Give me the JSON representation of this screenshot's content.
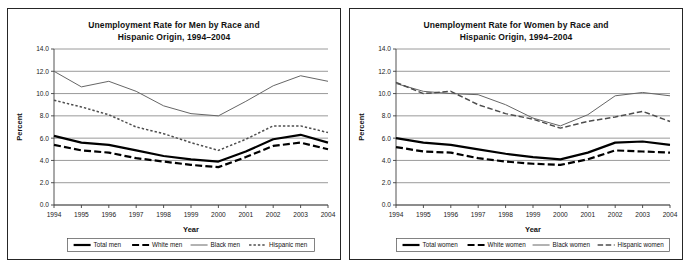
{
  "page": {
    "background": "#ffffff",
    "border_color": "#262626"
  },
  "charts": [
    {
      "id": "men",
      "title_line1": "Unemployment Rate for Men by Race and",
      "title_line2": "Hispanic Origin, 1994–2004",
      "ylabel": "Percent",
      "xlabel": "Year",
      "chart_data": {
        "type": "line",
        "title": "Unemployment Rate for Men by Race and Hispanic Origin, 1994–2004",
        "xlabel": "Year",
        "ylabel": "Percent",
        "x": [
          1994,
          1995,
          1996,
          1997,
          1998,
          1999,
          2000,
          2001,
          2002,
          2003,
          2004
        ],
        "categories": [
          "1994",
          "1995",
          "1996",
          "1997",
          "1998",
          "1999",
          "2000",
          "2001",
          "2002",
          "2003",
          "2004"
        ],
        "ylim": [
          0.0,
          14.0
        ],
        "yticks": [
          "0.0",
          "2.0",
          "4.0",
          "6.0",
          "8.0",
          "10.0",
          "12.0",
          "14.0"
        ],
        "ytick_values": [
          0.0,
          2.0,
          4.0,
          6.0,
          8.0,
          10.0,
          12.0,
          14.0
        ],
        "grid": true,
        "legend_position": "bottom",
        "series": [
          {
            "name": "Total men",
            "style": "solid-thick",
            "color": "#000000",
            "values": [
              6.2,
              5.6,
              5.4,
              4.9,
              4.4,
              4.1,
              3.9,
              4.8,
              5.9,
              6.3,
              5.6
            ]
          },
          {
            "name": "White men",
            "style": "dashed-thick",
            "color": "#000000",
            "values": [
              5.4,
              4.9,
              4.7,
              4.2,
              3.9,
              3.6,
              3.4,
              4.3,
              5.3,
              5.6,
              5.0
            ]
          },
          {
            "name": "Black men",
            "style": "solid-thin",
            "color": "#666666",
            "values": [
              12.0,
              10.6,
              11.1,
              10.2,
              8.9,
              8.2,
              8.0,
              9.3,
              10.7,
              11.6,
              11.1
            ]
          },
          {
            "name": "Hispanic men",
            "style": "dotted",
            "color": "#4d4d4d",
            "values": [
              9.4,
              8.8,
              8.1,
              7.0,
              6.4,
              5.6,
              4.9,
              5.9,
              7.1,
              7.1,
              6.5
            ]
          }
        ]
      }
    },
    {
      "id": "women",
      "title_line1": "Unemployment Rate for Women by Race and",
      "title_line2": "Hispanic Origin, 1994–2004",
      "ylabel": "Percent",
      "xlabel": "Year",
      "chart_data": {
        "type": "line",
        "title": "Unemployment Rate for Women by Race and Hispanic Origin, 1994–2004",
        "xlabel": "Year",
        "ylabel": "Percent",
        "x": [
          1994,
          1995,
          1996,
          1997,
          1998,
          1999,
          2000,
          2001,
          2002,
          2003,
          2004
        ],
        "categories": [
          "1994",
          "1995",
          "1996",
          "1997",
          "1998",
          "1999",
          "2000",
          "2001",
          "2002",
          "2003",
          "2004"
        ],
        "ylim": [
          0.0,
          14.0
        ],
        "yticks": [
          "0.0",
          "2.0",
          "4.0",
          "6.0",
          "8.0",
          "10.0",
          "12.0",
          "14.0"
        ],
        "ytick_values": [
          0.0,
          2.0,
          4.0,
          6.0,
          8.0,
          10.0,
          12.0,
          14.0
        ],
        "grid": true,
        "legend_position": "bottom",
        "series": [
          {
            "name": "Total women",
            "style": "solid-thick",
            "color": "#000000",
            "values": [
              6.0,
              5.6,
              5.4,
              5.0,
              4.6,
              4.3,
              4.1,
              4.7,
              5.6,
              5.7,
              5.4
            ]
          },
          {
            "name": "White women",
            "style": "dashed-thick",
            "color": "#000000",
            "values": [
              5.2,
              4.8,
              4.7,
              4.2,
              3.9,
              3.7,
              3.6,
              4.1,
              4.9,
              4.8,
              4.7
            ]
          },
          {
            "name": "Black women",
            "style": "solid-thin",
            "color": "#666666",
            "values": [
              10.9,
              10.2,
              10.0,
              9.9,
              9.0,
              7.8,
              7.1,
              8.1,
              9.8,
              10.1,
              9.8
            ]
          },
          {
            "name": "Hispanic women",
            "style": "dashed-thin",
            "color": "#4d4d4d",
            "values": [
              11.0,
              10.0,
              10.2,
              9.0,
              8.2,
              7.7,
              6.9,
              7.5,
              7.9,
              8.4,
              7.5
            ]
          }
        ]
      }
    }
  ]
}
